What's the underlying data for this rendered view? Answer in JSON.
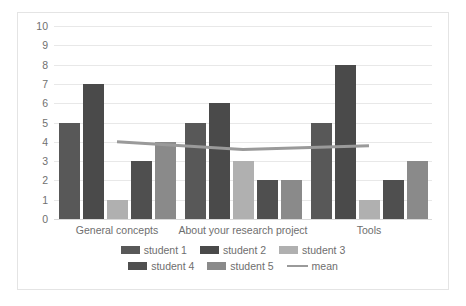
{
  "chart_data": {
    "type": "bar",
    "title": "",
    "xlabel": "",
    "ylabel": "",
    "ylim": [
      0,
      10
    ],
    "ytick_step": 1,
    "ytick_labels": [
      "10",
      "9",
      "8",
      "7",
      "6",
      "5",
      "4",
      "3",
      "2",
      "1",
      "0"
    ],
    "grid": true,
    "legend_position": "bottom",
    "categories": [
      "General concepts",
      "About your research project",
      "Tools"
    ],
    "series": [
      {
        "name": "student 1",
        "type": "bar",
        "color": "#585858",
        "values": [
          5,
          5,
          5
        ]
      },
      {
        "name": "student 2",
        "type": "bar",
        "color": "#4a4a4a",
        "values": [
          7,
          6,
          8
        ]
      },
      {
        "name": "student 3",
        "type": "bar",
        "color": "#b0b0b0",
        "values": [
          1,
          3,
          1
        ]
      },
      {
        "name": "student 4",
        "type": "bar",
        "color": "#4f4f4f",
        "values": [
          3,
          2,
          2
        ]
      },
      {
        "name": "student 5",
        "type": "bar",
        "color": "#8a8a8a",
        "values": [
          4,
          2,
          3
        ]
      },
      {
        "name": "mean",
        "type": "line",
        "color": "#9a9a9a",
        "values": [
          4.0,
          3.6,
          3.8
        ]
      }
    ]
  },
  "legend": {
    "rows": [
      [
        {
          "label": "student 1",
          "swatch": "bar-swatch",
          "color": "#585858"
        },
        {
          "label": "student 2",
          "swatch": "bar-swatch",
          "color": "#4a4a4a"
        },
        {
          "label": "student 3",
          "swatch": "bar-swatch",
          "color": "#b0b0b0"
        }
      ],
      [
        {
          "label": "student 4",
          "swatch": "bar-swatch",
          "color": "#4f4f4f"
        },
        {
          "label": "student 5",
          "swatch": "bar-swatch",
          "color": "#8a8a8a"
        },
        {
          "label": "mean",
          "swatch": "line-swatch",
          "color": "#9a9a9a"
        }
      ]
    ]
  }
}
